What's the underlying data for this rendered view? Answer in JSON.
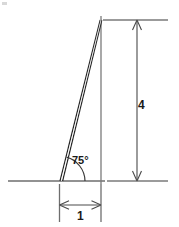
{
  "figure": {
    "type": "geometry-diagram",
    "labels": {
      "angle": "75°",
      "height": "4",
      "base": "1"
    },
    "colors": {
      "stroke_dark": "#1a1a1a",
      "stroke_light": "#8a8a8a",
      "background": "#ffffff",
      "text": "#1a1a1a"
    },
    "geometry": {
      "base_vertex": [
        60,
        181
      ],
      "apex": [
        101,
        20
      ],
      "right_angle_vertex": [
        101,
        181
      ],
      "baseline_y": 181,
      "baseline_x_start": 8,
      "baseline_x_end": 105,
      "vertical_side_x": 101,
      "angle_arc_radius": 25
    },
    "dimensions": {
      "height_dim": {
        "value": "4",
        "line_x": 137,
        "top_y": 20,
        "bottom_y": 181,
        "extension_top_y": 20,
        "extension_bottom_y": 181,
        "extension_x_end": 168
      },
      "base_dim": {
        "value": "1",
        "line_y": 205,
        "left_x": 60,
        "right_x": 101,
        "extension_y_end": 222
      }
    }
  }
}
